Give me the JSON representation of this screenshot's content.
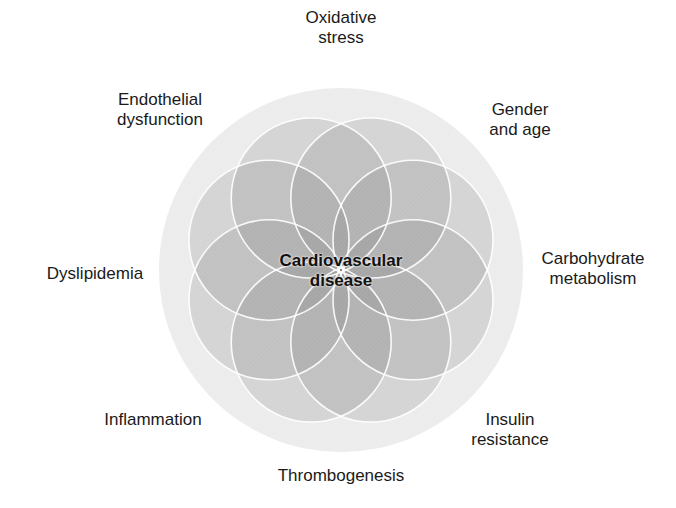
{
  "diagram": {
    "center": {
      "line1": "Cardiovascular",
      "line2": "disease"
    },
    "factors": [
      {
        "id": "oxidative-stress",
        "line1": "Oxidative",
        "line2": "stress"
      },
      {
        "id": "gender-and-age",
        "line1": "Gender",
        "line2": "and age"
      },
      {
        "id": "carbohydrate-metabolism",
        "line1": "Carbohydrate",
        "line2": "metabolism"
      },
      {
        "id": "insulin-resistance",
        "line1": "Insulin",
        "line2": "resistance"
      },
      {
        "id": "thrombogenesis",
        "line1": "Thrombogenesis",
        "line2": ""
      },
      {
        "id": "inflammation",
        "line1": "Inflammation",
        "line2": ""
      },
      {
        "id": "dyslipidemia",
        "line1": "Dyslipidemia",
        "line2": ""
      },
      {
        "id": "endothelial-dysfunction",
        "line1": "Endothelial",
        "line2": "dysfunction"
      }
    ],
    "colors": {
      "outer_disc": "#ececec",
      "petal_fill": "#7a7a7a",
      "petal_stroke": "#ffffff",
      "text": "#1a1a1a"
    }
  }
}
